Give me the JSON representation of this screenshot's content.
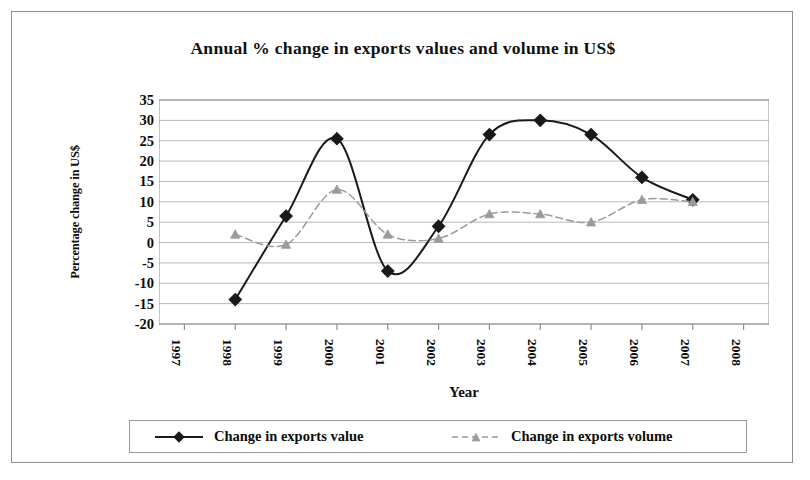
{
  "chart_data": {
    "type": "line",
    "title": "Annual % change in exports values and volume in US$",
    "xlabel": "Year",
    "ylabel": "Percentage change in US$",
    "categories": [
      "1997",
      "1998",
      "1999",
      "2000",
      "2001",
      "2002",
      "2003",
      "2004",
      "2005",
      "2006",
      "2007",
      "2008"
    ],
    "x_tick_labels": [
      "1997",
      "1998",
      "1999",
      "2000",
      "2001",
      "2002",
      "2003",
      "2004",
      "2005",
      "2006",
      "2007",
      "2008"
    ],
    "y_tick_labels": [
      "35",
      "30",
      "25",
      "20",
      "15",
      "10",
      "5",
      "0",
      "-5",
      "-10",
      "-15",
      "-20"
    ],
    "y_ticks": [
      35,
      30,
      25,
      20,
      15,
      10,
      5,
      0,
      -5,
      -10,
      -15,
      -20
    ],
    "ylim": [
      -20,
      35
    ],
    "grid": "horizontal",
    "legend_position": "bottom",
    "series": [
      {
        "name": "Change in exports value",
        "marker": "diamond",
        "line_style": "solid",
        "color": "#1a1a1a",
        "x": [
          "1998",
          "1999",
          "2000",
          "2001",
          "2002",
          "2003",
          "2004",
          "2005",
          "2006",
          "2007"
        ],
        "values": [
          -14,
          6.5,
          25.5,
          -7,
          4,
          26.5,
          30,
          26.5,
          16,
          10.5
        ]
      },
      {
        "name": "Change in exports volume",
        "marker": "triangle",
        "line_style": "dashed",
        "color": "#9b9b9b",
        "x": [
          "1998",
          "1999",
          "2000",
          "2001",
          "2002",
          "2003",
          "2004",
          "2005",
          "2006",
          "2007"
        ],
        "values": [
          2,
          -0.5,
          13,
          2,
          1,
          7,
          7,
          5,
          10.5,
          10
        ]
      }
    ]
  },
  "legend": {
    "entries": [
      {
        "label": "Change in exports value"
      },
      {
        "label": "Change in exports volume"
      }
    ]
  },
  "colors": {
    "value_series": "#1a1a1a",
    "volume_series": "#9b9b9b",
    "gridline": "#b9b9b9",
    "axis": "#8d8d8d",
    "frame": "#8d8d8d"
  }
}
